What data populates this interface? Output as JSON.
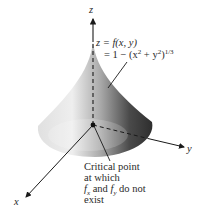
{
  "figure": {
    "axes": {
      "x_label": "x",
      "y_label": "y",
      "z_label": "z"
    },
    "equation": {
      "line1": "z = f(x, y)",
      "line2_prefix": "= 1 − (x",
      "line2_exp1": "2",
      "line2_mid": " + y",
      "line2_exp2": "2",
      "line2_close": ")",
      "line2_exp3": "1/3"
    },
    "annotation": {
      "line1": "Critical point",
      "line2": "at which",
      "line3_f1": "f",
      "line3_sub1": "x",
      "line3_and": " and ",
      "line3_f2": "f",
      "line3_sub2": "y",
      "line3_rest": " do not",
      "line4": "exist"
    },
    "colors": {
      "axis": "#1a1a1a",
      "surface_light": "#f2f2f2",
      "surface_dark": "#3a3a3a"
    }
  }
}
